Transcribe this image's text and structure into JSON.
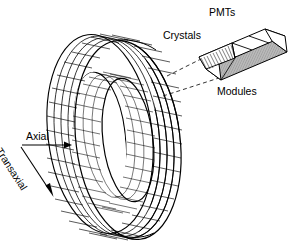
{
  "figure": {
    "background_color": "#ffffff",
    "ink_color": "#000000",
    "width": 299,
    "height": 252
  },
  "labels": {
    "pmts": "PMTs",
    "crystals": "Crystals",
    "modules": "Modules",
    "axial": "Axial",
    "transaxial": "Transaxial"
  },
  "diagram": {
    "ring": {
      "name": "detector-ring",
      "shape": "annular cylinder in perspective",
      "outer_ellipse": {
        "cx": 128,
        "cy": 140,
        "rx": 52,
        "ry": 100,
        "rotation_deg": -7
      },
      "inner_ellipse": {
        "cx": 128,
        "cy": 140,
        "rx": 25,
        "ry": 62,
        "rotation_deg": -7
      },
      "depth_offset_x": -28,
      "depth_offset_y": -6,
      "azimuthal_segments": 60,
      "axial_rows": 4
    },
    "module": {
      "name": "detector-module-block",
      "pmt_count_top": 4,
      "crystal_face": "hatched end face",
      "shaded_face_color": "#b9b9b9"
    },
    "leader_lines": {
      "style": "dashed",
      "count": 2,
      "from": "ring outer surface",
      "to": "module block"
    },
    "arrows": {
      "axial": {
        "x1": 22,
        "y1": 145,
        "x2": 68,
        "y2": 145,
        "direction": "right"
      },
      "transaxial": {
        "x1": 20,
        "y1": 147,
        "x2": 53,
        "y2": 197,
        "direction": "down-right"
      }
    }
  }
}
